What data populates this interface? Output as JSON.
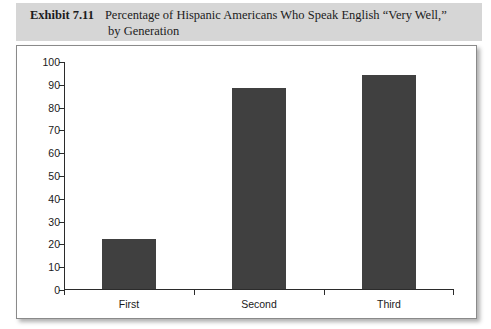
{
  "header": {
    "exhibit_label": "Exhibit 7.11",
    "title_line1": "Percentage of Hispanic Americans Who Speak English “Very Well,”",
    "title_line2": "by Generation",
    "band_color": "#d6d6d6"
  },
  "chart_data": {
    "type": "bar",
    "title": "Percentage of Hispanic Americans Who Speak English “Very Well,” by Generation",
    "categories": [
      "First",
      "Second",
      "Third"
    ],
    "values": [
      22,
      88,
      94
    ],
    "xlabel": "",
    "ylabel": "",
    "ylim": [
      0,
      100
    ],
    "yticks": [
      0,
      10,
      20,
      30,
      40,
      50,
      60,
      70,
      80,
      90,
      100
    ],
    "ytick_labels": [
      "0",
      "10",
      "20",
      "30",
      "40",
      "50",
      "60",
      "70",
      "80",
      "90",
      "100"
    ],
    "grid": false,
    "legend": false,
    "bar_color": "#404040",
    "axis_color": "#2b2b2b"
  }
}
